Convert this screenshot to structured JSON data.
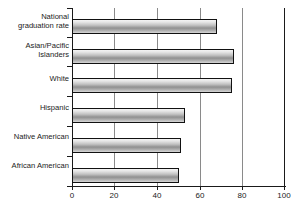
{
  "chart_data": {
    "type": "bar",
    "orientation": "horizontal",
    "title": "",
    "subtitle": "",
    "xlabel": "",
    "ylabel": "",
    "xlim": [
      0,
      100
    ],
    "xticks": [
      0,
      20,
      40,
      60,
      80,
      100
    ],
    "xtick_labels": [
      "0",
      "20",
      "40",
      "60",
      "80",
      "100"
    ],
    "grid": "vertical",
    "legend": "none",
    "categories": [
      "National\ngraduation rate",
      "Asian/Pacific\nIslanders",
      "White",
      "Hispanic",
      "Native American",
      "African American"
    ],
    "values": [
      68,
      76,
      75,
      53,
      51,
      50
    ],
    "bar_fill": "#b8b8b8",
    "bar_outline": "#111111",
    "gridline_color": "#8a8a8a",
    "axis_color": "#1a1a1a",
    "background": "#ffffff"
  }
}
